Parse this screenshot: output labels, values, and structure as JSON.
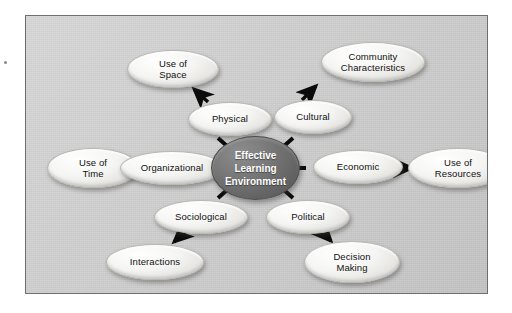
{
  "diagram": {
    "center": {
      "label": "Effective Learning Environment",
      "lines": [
        "Effective",
        "Learning",
        "Environment"
      ],
      "fill": "#6b6b6b",
      "text_color": "#ffffff"
    },
    "panel": {
      "background": "#cdcdcd",
      "border_color": "#6e6e6e"
    },
    "node_style": {
      "fill": "#f2f2f0",
      "border": "#b9b8b3",
      "text_color": "#111111"
    },
    "inner_nodes": [
      {
        "id": "physical",
        "label": "Physical",
        "lines": [
          "Physical"
        ],
        "x": 162,
        "y": 86,
        "w": 84,
        "h": 34
      },
      {
        "id": "cultural",
        "label": "Cultural",
        "lines": [
          "Cultural"
        ],
        "x": 248,
        "y": 84,
        "w": 78,
        "h": 34
      },
      {
        "id": "organizational",
        "label": "Organizational",
        "lines": [
          "Organizational"
        ],
        "x": 94,
        "y": 135,
        "w": 104,
        "h": 34
      },
      {
        "id": "economic",
        "label": "Economic",
        "lines": [
          "Economic"
        ],
        "x": 287,
        "y": 134,
        "w": 90,
        "h": 34
      },
      {
        "id": "sociological",
        "label": "Sociological",
        "lines": [
          "Sociological"
        ],
        "x": 128,
        "y": 184,
        "w": 94,
        "h": 34
      },
      {
        "id": "political",
        "label": "Political",
        "lines": [
          "Political"
        ],
        "x": 240,
        "y": 184,
        "w": 84,
        "h": 34
      }
    ],
    "outer_nodes": [
      {
        "id": "use-of-space",
        "label": "Use of Space",
        "lines": [
          "Use of",
          "Space"
        ],
        "x": 101,
        "y": 34,
        "w": 92,
        "h": 38
      },
      {
        "id": "community-characteristics",
        "label": "Community Characteristics",
        "lines": [
          "Community",
          "Characteristics"
        ],
        "x": 295,
        "y": 26,
        "w": 104,
        "h": 40
      },
      {
        "id": "use-of-time",
        "label": "Use of Time",
        "lines": [
          "Use of",
          "Time"
        ],
        "x": 21,
        "y": 132,
        "w": 92,
        "h": 40
      },
      {
        "id": "use-of-resources",
        "label": "Use of Resources",
        "lines": [
          "Use of",
          "Resources"
        ],
        "x": 382,
        "y": 132,
        "w": 100,
        "h": 40
      },
      {
        "id": "interactions",
        "label": "Interactions",
        "lines": [
          "Interactions"
        ],
        "x": 80,
        "y": 228,
        "w": 98,
        "h": 36
      },
      {
        "id": "decision-making",
        "label": "Decision Making",
        "lines": [
          "Decision",
          "Making"
        ],
        "x": 278,
        "y": 225,
        "w": 96,
        "h": 42
      }
    ],
    "arrows": [
      {
        "id": "physical-to-use-of-space",
        "from": "physical",
        "to": "use-of-space",
        "direction": "up-left"
      },
      {
        "id": "cultural-to-community-characteristics",
        "from": "cultural",
        "to": "community-characteristics",
        "direction": "up-right"
      },
      {
        "id": "organizational-to-use-of-time",
        "from": "organizational",
        "to": "use-of-time",
        "direction": "left"
      },
      {
        "id": "economic-to-use-of-resources",
        "from": "economic",
        "to": "use-of-resources",
        "direction": "right"
      },
      {
        "id": "sociological-to-interactions",
        "from": "sociological",
        "to": "interactions",
        "direction": "down-left"
      },
      {
        "id": "political-to-decision-making",
        "from": "political",
        "to": "decision-making",
        "direction": "down-right"
      }
    ],
    "spokes": [
      {
        "id": "spoke-physical",
        "to": "physical"
      },
      {
        "id": "spoke-cultural",
        "to": "cultural"
      },
      {
        "id": "spoke-organizational",
        "to": "organizational"
      },
      {
        "id": "spoke-economic",
        "to": "economic"
      },
      {
        "id": "spoke-sociological",
        "to": "sociological"
      },
      {
        "id": "spoke-political",
        "to": "political"
      }
    ]
  }
}
